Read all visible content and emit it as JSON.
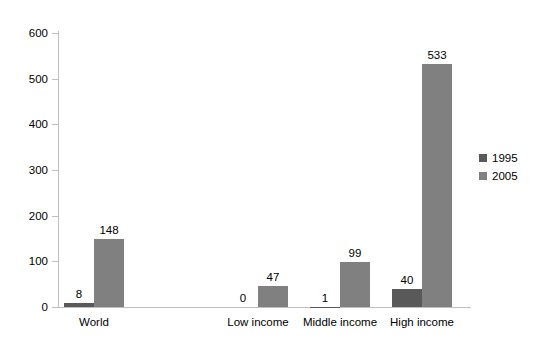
{
  "chart_data": {
    "type": "bar",
    "title": "",
    "subtitle": "",
    "xlabel": "",
    "ylabel": "",
    "ylim": [
      0,
      600
    ],
    "ytick_step": 100,
    "yticks": [
      0,
      100,
      200,
      300,
      400,
      500,
      600
    ],
    "ytick_labels": [
      "0",
      "100",
      "200",
      "300",
      "400",
      "500",
      "600"
    ],
    "grid": false,
    "legend_position": "right",
    "categories": [
      "World",
      "",
      "Low income",
      "Middle income",
      "High income"
    ],
    "series": [
      {
        "name": "1995",
        "color": "#595959",
        "values": [
          8,
          null,
          0,
          1,
          40
        ],
        "labels": [
          "8",
          "",
          "0",
          "1",
          "40"
        ]
      },
      {
        "name": "2005",
        "color": "#808080",
        "values": [
          148,
          null,
          47,
          99,
          533
        ],
        "labels": [
          "148",
          "",
          "47",
          "99",
          "533"
        ]
      }
    ],
    "axis_color": "#bfbfbf"
  }
}
